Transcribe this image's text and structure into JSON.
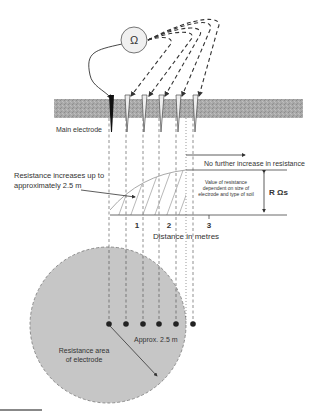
{
  "diagram": {
    "meter_symbol": "Ω",
    "labels": {
      "main_electrode": "Main electrode",
      "no_further_increase": "No further increase in resistance",
      "resistance_increases_line1": "Resistance increases up to",
      "resistance_increases_line2": "approximately 2.5 m",
      "value_note_line1": "Value of resistance",
      "value_note_line2": "dependent on size of",
      "value_note_line3": "electrode and type of soil",
      "r_label": "R Ωs",
      "x_axis_title": "Distance in metres",
      "approx_radius": "Approx. 2.5 m",
      "area_line1": "Resistance area",
      "area_line2": "of electrode"
    },
    "ticks": [
      {
        "label": "1"
      },
      {
        "label": "2"
      },
      {
        "label": "3"
      }
    ],
    "electrodes": [
      {
        "type": "main"
      },
      {
        "type": "test"
      },
      {
        "type": "test"
      },
      {
        "type": "test"
      },
      {
        "type": "test"
      },
      {
        "type": "test"
      }
    ],
    "colors": {
      "ground": "#a8a8a8",
      "resistance_area": "#c4c4c4",
      "curve": "#aaaaaa",
      "line": "#333333"
    }
  }
}
